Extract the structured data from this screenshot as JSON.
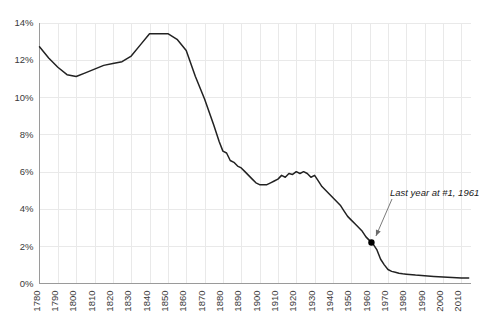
{
  "chart_data": {
    "type": "line",
    "title": "",
    "subtitle": "",
    "xlabel": "",
    "ylabel": "",
    "xlim": [
      1780,
      2015
    ],
    "ylim": [
      0,
      14
    ],
    "grid": true,
    "legend_position": "none",
    "y_tick_labels": [
      "14%",
      "12%",
      "10%",
      "8%",
      "6%",
      "4%",
      "2%",
      "0%"
    ],
    "y_tick_values": [
      14,
      12,
      10,
      8,
      6,
      4,
      2,
      0
    ],
    "x_tick_labels": [
      "1780",
      "1790",
      "1800",
      "1810",
      "1820",
      "1830",
      "1840",
      "1850",
      "1860",
      "1870",
      "1880",
      "1890",
      "1900",
      "1910",
      "1920",
      "1930",
      "1940",
      "1950",
      "1960",
      "1970",
      "1980",
      "1990",
      "2000",
      "2010"
    ],
    "x_tick_values": [
      1780,
      1790,
      1800,
      1810,
      1820,
      1830,
      1840,
      1850,
      1860,
      1870,
      1880,
      1890,
      1900,
      1910,
      1920,
      1930,
      1940,
      1950,
      1960,
      1970,
      1980,
      1990,
      2000,
      2010
    ],
    "series": [
      {
        "name": "share",
        "color": "#222222",
        "x": [
          1780,
          1785,
          1790,
          1795,
          1800,
          1805,
          1810,
          1815,
          1820,
          1825,
          1830,
          1835,
          1840,
          1845,
          1850,
          1855,
          1860,
          1865,
          1870,
          1875,
          1878,
          1880,
          1882,
          1884,
          1886,
          1888,
          1890,
          1892,
          1894,
          1896,
          1898,
          1900,
          1902,
          1904,
          1906,
          1908,
          1910,
          1912,
          1914,
          1916,
          1918,
          1920,
          1922,
          1924,
          1926,
          1928,
          1930,
          1932,
          1934,
          1936,
          1938,
          1940,
          1942,
          1944,
          1946,
          1948,
          1950,
          1952,
          1954,
          1956,
          1958,
          1960,
          1961,
          1962,
          1964,
          1966,
          1968,
          1970,
          1972,
          1974,
          1976,
          1978,
          1980,
          1985,
          1990,
          1995,
          2000,
          2005,
          2010,
          2014
        ],
        "y": [
          12.7,
          12.1,
          11.6,
          11.2,
          11.1,
          11.3,
          11.5,
          11.7,
          11.8,
          11.9,
          12.2,
          12.8,
          13.4,
          13.4,
          13.4,
          13.1,
          12.5,
          11.1,
          9.9,
          8.5,
          7.6,
          7.1,
          7.0,
          6.6,
          6.5,
          6.3,
          6.2,
          6.0,
          5.8,
          5.6,
          5.4,
          5.3,
          5.3,
          5.3,
          5.4,
          5.5,
          5.6,
          5.8,
          5.7,
          5.9,
          5.85,
          6.0,
          5.9,
          6.0,
          5.9,
          5.7,
          5.8,
          5.5,
          5.2,
          5.0,
          4.8,
          4.6,
          4.4,
          4.2,
          3.9,
          3.6,
          3.4,
          3.2,
          3.0,
          2.8,
          2.5,
          2.3,
          2.2,
          2.1,
          1.8,
          1.3,
          1.0,
          0.75,
          0.65,
          0.6,
          0.55,
          0.52,
          0.5,
          0.45,
          0.42,
          0.38,
          0.35,
          0.32,
          0.3,
          0.3
        ]
      }
    ],
    "annotations": [
      {
        "text": "Last year at #1, 1961",
        "point_x": 1961,
        "point_y": 2.2,
        "marker": "dot"
      }
    ]
  }
}
